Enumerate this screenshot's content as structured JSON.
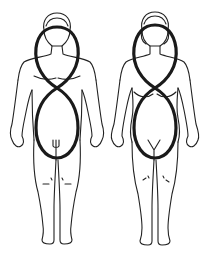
{
  "figure": {
    "figures": [
      {
        "id": "male",
        "label": "male-figure"
      },
      {
        "id": "female",
        "label": "female-figure"
      }
    ],
    "colors": {
      "background": "#ffffff",
      "outline": "#222222",
      "loop": "#1a1a1a"
    }
  }
}
